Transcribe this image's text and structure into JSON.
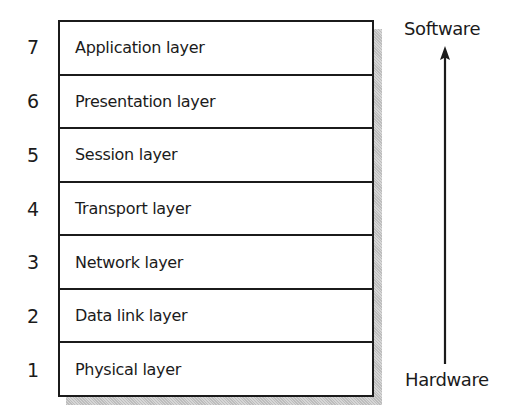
{
  "diagram": {
    "type": "layer-stack",
    "title": "",
    "layers": [
      {
        "number": "7",
        "label": "Application layer"
      },
      {
        "number": "6",
        "label": "Presentation layer"
      },
      {
        "number": "5",
        "label": "Session layer"
      },
      {
        "number": "4",
        "label": "Transport layer"
      },
      {
        "number": "3",
        "label": "Network layer"
      },
      {
        "number": "2",
        "label": "Data link layer"
      },
      {
        "number": "1",
        "label": "Physical layer"
      }
    ],
    "axis": {
      "top_label": "Software",
      "bottom_label": "Hardware",
      "direction": "up",
      "icon": "arrow-up-icon"
    }
  },
  "colors": {
    "ink": "#1b1b1b",
    "shadow": "#c9c9c9",
    "background": "#ffffff"
  }
}
